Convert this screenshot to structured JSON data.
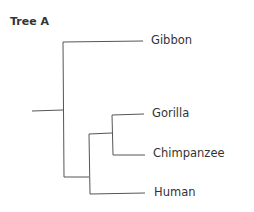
{
  "title": "Tree A",
  "tree": {
    "leaves": [
      {
        "name": "Gibbon"
      },
      {
        "name": "Gorilla"
      },
      {
        "name": "Chimpanzee"
      },
      {
        "name": "Human"
      }
    ],
    "topology": "(Gibbon,((Gorilla,Chimpanzee),Human))"
  }
}
